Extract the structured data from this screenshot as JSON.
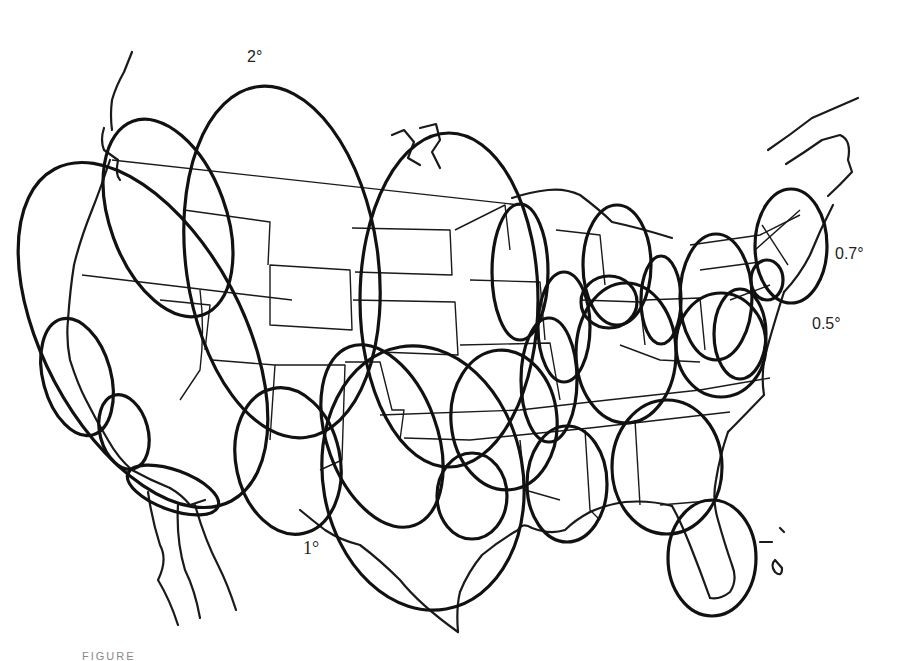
{
  "figure": {
    "title": "",
    "caption_visible": "FIGURE",
    "background": "#ffffff",
    "ink_color": "#111111"
  },
  "labels": [
    {
      "id": "beam-2deg",
      "text": "2°",
      "x": 247,
      "y": 48,
      "serif": false
    },
    {
      "id": "beam-0-7deg",
      "text": "0.7°",
      "x": 835,
      "y": 245,
      "serif": false
    },
    {
      "id": "beam-0-5deg",
      "text": "0.5°",
      "x": 812,
      "y": 315,
      "serif": false
    },
    {
      "id": "beam-1deg",
      "text": "1°",
      "x": 303,
      "y": 538,
      "serif": true
    }
  ],
  "beams": [
    {
      "cx": 143,
      "cy": 335,
      "rx": 100,
      "ry": 188,
      "rot": -28
    },
    {
      "cx": 168,
      "cy": 218,
      "rx": 58,
      "ry": 103,
      "rot": -20
    },
    {
      "cx": 282,
      "cy": 262,
      "rx": 96,
      "ry": 177,
      "rot": -8
    },
    {
      "cx": 382,
      "cy": 436,
      "rx": 55,
      "ry": 95,
      "rot": -20
    },
    {
      "cx": 77,
      "cy": 377,
      "rx": 34,
      "ry": 60,
      "rot": -15
    },
    {
      "cx": 124,
      "cy": 432,
      "rx": 24,
      "ry": 38,
      "rot": -15
    },
    {
      "cx": 288,
      "cy": 461,
      "rx": 52,
      "ry": 74,
      "rot": -12
    },
    {
      "cx": 423,
      "cy": 478,
      "rx": 100,
      "ry": 133,
      "rot": -10
    },
    {
      "cx": 449,
      "cy": 300,
      "rx": 89,
      "ry": 167,
      "rot": 0
    },
    {
      "cx": 504,
      "cy": 420,
      "rx": 53,
      "ry": 70,
      "rot": -5
    },
    {
      "cx": 472,
      "cy": 496,
      "rx": 35,
      "ry": 43,
      "rot": 0
    },
    {
      "cx": 520,
      "cy": 272,
      "rx": 28,
      "ry": 68,
      "rot": 0
    },
    {
      "cx": 564,
      "cy": 327,
      "rx": 26,
      "ry": 55,
      "rot": 0
    },
    {
      "cx": 549,
      "cy": 380,
      "rx": 28,
      "ry": 62,
      "rot": 0
    },
    {
      "cx": 617,
      "cy": 265,
      "rx": 34,
      "ry": 60,
      "rot": 0
    },
    {
      "cx": 609,
      "cy": 302,
      "rx": 28,
      "ry": 26,
      "rot": 0
    },
    {
      "cx": 661,
      "cy": 300,
      "rx": 20,
      "ry": 44,
      "rot": 0
    },
    {
      "cx": 626,
      "cy": 353,
      "rx": 50,
      "ry": 70,
      "rot": 0
    },
    {
      "cx": 567,
      "cy": 484,
      "rx": 40,
      "ry": 58,
      "rot": 0
    },
    {
      "cx": 667,
      "cy": 467,
      "rx": 55,
      "ry": 67,
      "rot": 0
    },
    {
      "cx": 716,
      "cy": 297,
      "rx": 36,
      "ry": 63,
      "rot": 0
    },
    {
      "cx": 740,
      "cy": 334,
      "rx": 26,
      "ry": 45,
      "rot": 0
    },
    {
      "cx": 721,
      "cy": 345,
      "rx": 45,
      "ry": 52,
      "rot": 0
    },
    {
      "cx": 767,
      "cy": 280,
      "rx": 16,
      "ry": 20,
      "rot": 0
    },
    {
      "cx": 791,
      "cy": 246,
      "rx": 36,
      "ry": 57,
      "rot": 0
    },
    {
      "cx": 712,
      "cy": 558,
      "rx": 44,
      "ry": 58,
      "rot": 0
    },
    {
      "cx": 173,
      "cy": 490,
      "rx": 48,
      "ry": 20,
      "rot": 20
    }
  ],
  "coastline_paths": [
    "M132,52 Q128,62 124,72 Q116,86 112,100 Q110,115 112,130",
    "M104,128 Q100,140 104,150 L118,160 Q115,175 120,180",
    "M110,160 Q100,190 92,210 Q80,240 74,265 Q70,290 68,320 Q66,340 70,360 Q78,385 86,400 Q96,420 108,440 Q118,458 132,470 Q150,480 170,488",
    "M170,488 Q182,495 190,505 L205,500",
    "M148,492 Q152,520 160,545 Q168,560 158,580 Q170,600 178,625",
    "M178,505 Q176,540 185,570 Q195,590 200,618",
    "M195,505 Q205,540 218,565 Q228,585 236,610",
    "M392,135 L404,130 L414,142 L408,158 L420,165",
    "M420,128 L436,124 L440,140 L432,152 L440,168",
    "M512,198 Q530,192 548,190 Q565,188 580,195 Q600,210 612,222 Q640,228 672,238",
    "M768,150 Q790,135 812,118 Q835,108 858,98",
    "M786,164 Q805,152 822,140 L840,135 Q852,140 848,160 L852,172 Q840,185 828,196",
    "M833,205 Q820,230 810,255 Q800,275 784,292",
    "M784,292 Q775,320 768,345 Q760,370 764,395 Q740,420 728,432",
    "M728,432 Q720,455 716,480 Q712,500 718,520 Q725,545 732,565 Q738,580 730,592 Q720,600 710,598",
    "M710,598 Q700,570 690,545 Q680,520 672,506",
    "M672,506 Q650,500 625,502 Q605,505 590,512",
    "M590,512 Q575,520 565,530 Q550,535 532,528 Q522,522 518,530",
    "M518,530 Q500,540 482,555 Q468,572 460,592 Q456,608 458,632",
    "M458,632 Q420,605 400,580 Q380,560 360,545 Q340,540 325,530 Q312,520 300,510"
  ],
  "border_paths": [
    "M112,160 L520,205",
    "M82,275 L292,300",
    "M160,300 L210,305 L205,350",
    "M270,265 L350,270 L352,330 L270,325 Z",
    "M352,228 L450,230 L452,275 L355,272",
    "M353,300 L455,302 L458,355 L380,352",
    "M184,210 L270,222 L268,265",
    "M200,290 Q205,330 200,370 L180,400",
    "M212,360 L275,365 L270,440",
    "M275,365 L345,365 L342,460 L320,470",
    "M345,362 L380,362 L392,410 L404,410 L400,440",
    "M380,415 L520,410 L608,400 L700,390 L770,378",
    "M404,438 L470,440 L520,435 L590,428 L660,420 L730,412",
    "M455,230 L505,205 L510,250",
    "M470,280 L540,282 L545,340",
    "M460,345 L550,343 L560,400",
    "M556,230 L600,235 L605,285",
    "M580,300 L640,302 L645,345",
    "M645,300 L700,298 L705,350",
    "M620,345 L660,360 L700,362",
    "M520,440 L525,490 L560,500",
    "M585,430 L590,510 L600,520",
    "M635,420 L640,505",
    "M660,505 L720,500",
    "M690,245 L760,235 L800,215",
    "M700,270 L760,262",
    "M730,300 L770,285",
    "M755,250 L800,210",
    "M762,225 L788,265"
  ],
  "island_paths": [
    "M760,542 L772,542",
    "M780,528 L784,532",
    "M775,560 Q770,565 775,572 Q782,578 782,568 Z"
  ]
}
